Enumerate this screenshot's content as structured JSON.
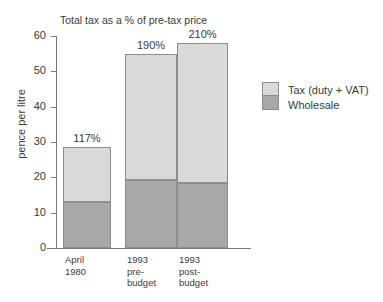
{
  "chart_data": {
    "type": "bar",
    "subtype": "stacked",
    "title": "Total tax as a % of pre-tax price",
    "xlabel": "",
    "ylabel": "pence per litre",
    "ylim": [
      0,
      60
    ],
    "yticks": [
      0,
      10,
      20,
      30,
      40,
      50,
      60
    ],
    "ytick_labels": [
      "0",
      "10",
      "20",
      "30",
      "40",
      "50",
      "60"
    ],
    "grid": false,
    "legend_position": "right",
    "categories": [
      "April\n1980",
      "1993\npre-\nbudget",
      "1993\npost-\nbudget"
    ],
    "series": [
      {
        "name": "Wholesale",
        "color": "#a8a8a8",
        "values": [
          13.0,
          19.3,
          18.5
        ]
      },
      {
        "name": "Tax (duty + VAT)",
        "color": "#d9d9d9",
        "values": [
          15.5,
          35.7,
          39.5
        ]
      }
    ],
    "totals": [
      28.5,
      55.0,
      58.0
    ],
    "annotations": [
      "117%",
      "190%",
      "210%"
    ]
  },
  "legend": {
    "items": [
      {
        "label": "Tax (duty + VAT)",
        "color": "#d9d9d9"
      },
      {
        "label": "Wholesale",
        "color": "#a8a8a8"
      }
    ]
  },
  "colors": {
    "tax": "#d9d9d9",
    "wholesale": "#a8a8a8",
    "border": "#8d8d8d",
    "axis": "#7a7a7a",
    "text": "#3a3a3a",
    "background": "#ffffff"
  }
}
